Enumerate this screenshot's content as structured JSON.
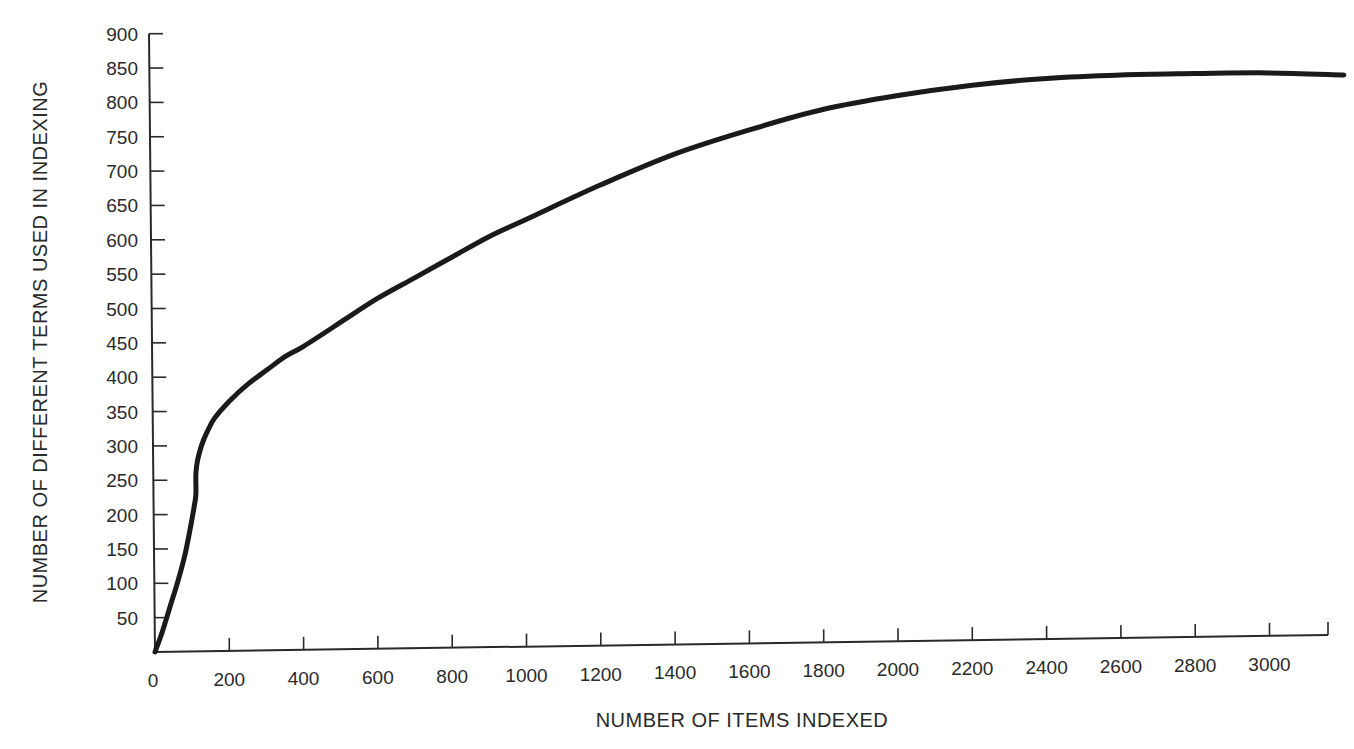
{
  "chart_data": {
    "type": "line",
    "title": "",
    "xlabel": "NUMBER OF ITEMS INDEXED",
    "ylabel": "NUMBER OF DIFFERENT TERMS USED IN INDEXING",
    "xlim": [
      0,
      3200
    ],
    "ylim": [
      0,
      900
    ],
    "grid": false,
    "legend": null,
    "x_ticks": [
      0,
      200,
      400,
      600,
      800,
      1000,
      1200,
      1400,
      1600,
      1800,
      2000,
      2200,
      2400,
      2600,
      2800,
      3000
    ],
    "y_ticks": [
      50,
      100,
      150,
      200,
      250,
      300,
      350,
      400,
      450,
      500,
      550,
      600,
      650,
      700,
      750,
      800,
      850,
      900
    ],
    "series": [
      {
        "name": "terms vs items",
        "color": "#1a1a1a",
        "x": [
          0,
          20,
          40,
          60,
          80,
          95,
          105,
          110,
          110,
          115,
          125,
          140,
          160,
          200,
          250,
          300,
          350,
          400,
          500,
          600,
          700,
          800,
          900,
          1000,
          1200,
          1400,
          1600,
          1800,
          2000,
          2200,
          2400,
          2600,
          2800,
          3000,
          3200
        ],
        "y": [
          0,
          30,
          65,
          100,
          140,
          180,
          210,
          230,
          260,
          280,
          300,
          320,
          340,
          365,
          390,
          410,
          430,
          445,
          480,
          515,
          545,
          575,
          605,
          630,
          680,
          725,
          760,
          790,
          810,
          825,
          835,
          840,
          842,
          843,
          840
        ]
      }
    ]
  }
}
